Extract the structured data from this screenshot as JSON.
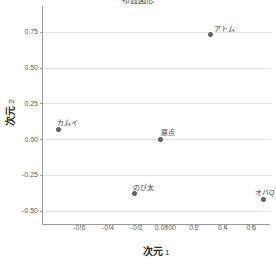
{
  "chart_data": {
    "type": "scatter",
    "title": "布置図形",
    "xlabel": "次元 1",
    "ylabel": "次元 2",
    "xlim": [
      -0.86,
      0.73
    ],
    "ylim": [
      -0.6,
      0.93
    ],
    "xticks": [
      -0.6,
      -0.4,
      -0.2,
      0.0,
      0.2,
      0.4,
      0.6
    ],
    "xticklabels": [
      "-0.6",
      "-0.4",
      "-0.2",
      "0.0000",
      "0.2",
      "0.4",
      "0.6"
    ],
    "yticks": [
      0.75,
      0.5,
      0.25,
      0.0,
      -0.25,
      -0.5
    ],
    "yticklabels": [
      "0.75",
      "0.50",
      "0.25",
      "0.00",
      "-0.25",
      "-0.50"
    ],
    "grid": "horizontal",
    "legend": "none",
    "point_color": "#6b6b6b",
    "grid_color": "#e4e4e4",
    "axis_color": "#9a9a9a",
    "points": [
      {
        "label": "アトム",
        "x": 0.31,
        "y": 0.73,
        "label_dx": 14,
        "label_dy": -10
      },
      {
        "label": "カムイ",
        "x": -0.75,
        "y": 0.07,
        "label_dx": 9,
        "label_dy": -10
      },
      {
        "label": "原点",
        "x": -0.04,
        "y": 0.0,
        "label_dx": 7,
        "label_dy": -10
      },
      {
        "label": "のび太",
        "x": -0.22,
        "y": -0.38,
        "label_dx": 9,
        "label_dy": -10
      },
      {
        "label": "オバQ",
        "x": 0.68,
        "y": -0.42,
        "label_dx": 1,
        "label_dy": -10
      }
    ]
  }
}
